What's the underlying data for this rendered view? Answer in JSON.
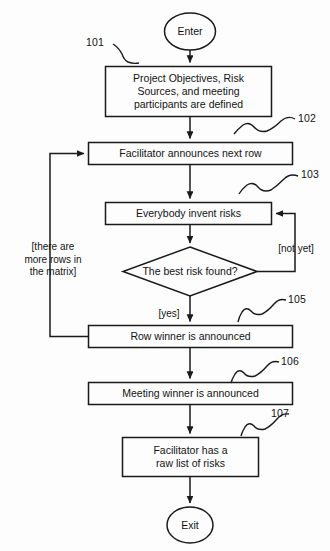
{
  "diagram": {
    "type": "flowchart",
    "terminators": [
      {
        "id": "enter",
        "label": "Enter"
      },
      {
        "id": "exit",
        "label": "Exit"
      }
    ],
    "process_nodes": [
      {
        "id": "n101",
        "ref": "101",
        "label": "Project Objectives, Risk\nSources, and meeting\nparticipants are defined"
      },
      {
        "id": "n102",
        "ref": "102",
        "label": "Facilitator announces next row"
      },
      {
        "id": "n103",
        "ref": "103",
        "label": "Everybody invent risks"
      },
      {
        "id": "n105",
        "ref": "105",
        "label": "Row winner is announced"
      },
      {
        "id": "n106",
        "ref": "106",
        "label": "Meeting winner is announced"
      },
      {
        "id": "n107",
        "ref": "107",
        "label": "Facilitator has a\nraw list of risks"
      }
    ],
    "decision_nodes": [
      {
        "id": "d104",
        "label": "The best risk found?"
      }
    ],
    "edge_labels": [
      {
        "id": "e-not-yet",
        "label": "[not yet]"
      },
      {
        "id": "e-yes",
        "label": "[yes]"
      },
      {
        "id": "e-more-rows",
        "label": "[there are\nmore rows in\nthe matrix]"
      }
    ],
    "reference_numerals": [
      "101",
      "102",
      "103",
      "105",
      "106",
      "107"
    ],
    "colors": {
      "stroke": "#1a1a1a",
      "background": "#fdfdfd",
      "text": "#131313"
    }
  }
}
